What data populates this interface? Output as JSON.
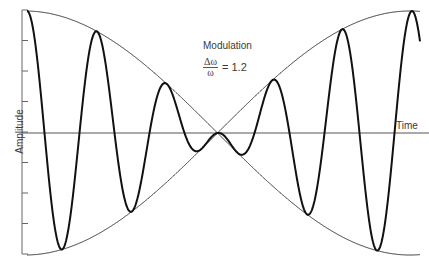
{
  "chart_data": {
    "type": "line",
    "title": "Modulation",
    "annotation": {
      "numerator": "Δω",
      "denominator": "ω",
      "equals": "= 1.2"
    },
    "xlabel": "Time",
    "ylabel": "Amplitude",
    "grid": false,
    "legend": null,
    "y_ticks_count": 7,
    "series": [
      {
        "name": "modulated signal",
        "description": "carrier × cosine envelope (beats)",
        "peaks_px": [
          [
            27,
            10
          ],
          [
            91,
            33
          ],
          [
            161,
            82
          ],
          [
            271,
            84
          ],
          [
            343,
            35
          ],
          [
            413,
            13
          ]
        ],
        "troughs_px": [
          [
            54,
            246
          ],
          [
            125,
            208
          ],
          [
            195,
            150
          ],
          [
            237,
            150
          ],
          [
            304,
            209
          ],
          [
            375,
            247
          ]
        ]
      },
      {
        "name": "envelope upper/lower",
        "description": "two crossing cosine curves meeting at center",
        "cross_px": [
          216,
          133
        ]
      }
    ],
    "params": {
      "axis_x": 22,
      "axis_top": 10,
      "axis_bottom": 254,
      "baseline_y": 133,
      "x_start": 27,
      "x_end": 420,
      "env_x0": 25,
      "env_x1": 410,
      "amplitude": 122,
      "carrier_period": 70
    }
  },
  "labels": {
    "title": "Modulation",
    "num": "Δω",
    "den": "ω",
    "eq": "= 1.2",
    "xlabel": "Time",
    "ylabel": "Amplitude"
  }
}
